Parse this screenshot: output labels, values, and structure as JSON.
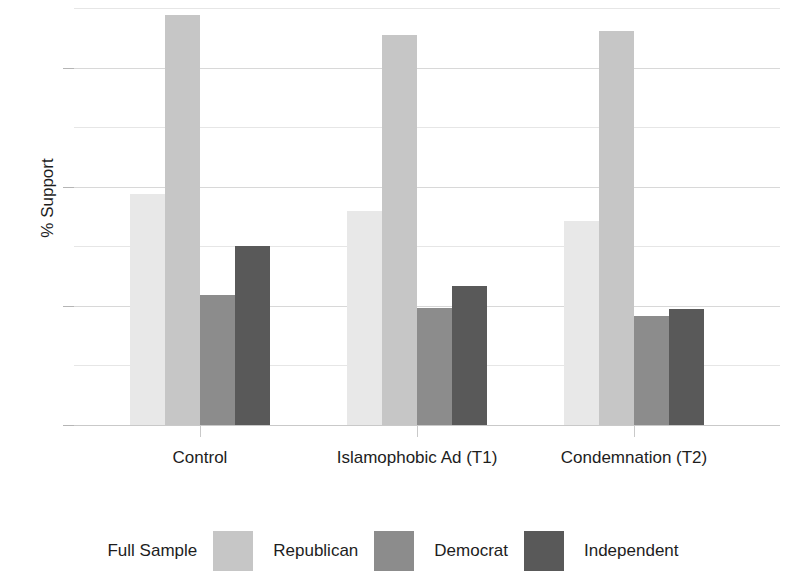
{
  "chart_data": {
    "type": "bar",
    "title": "",
    "xlabel": "",
    "ylabel": "% Support",
    "ylim": [
      0,
      70
    ],
    "y_ticks": [
      0,
      20,
      40,
      60
    ],
    "y_tick_labels": [
      "0",
      "20",
      "40",
      "60"
    ],
    "y_minor_ticks": [
      10,
      30,
      50,
      70
    ],
    "grid": true,
    "legend_position": "bottom",
    "categories": [
      "Control",
      "Islamophobic Ad (T1)",
      "Condemnation (T2)"
    ],
    "series": [
      {
        "name": "Full Sample",
        "color": "#e8e8e8",
        "values": [
          38.8,
          35.9,
          34.3
        ]
      },
      {
        "name": "Republican",
        "color": "#c6c6c6",
        "values": [
          68.8,
          65.4,
          66.2
        ]
      },
      {
        "name": "Democrat",
        "color": "#8c8c8c",
        "values": [
          21.9,
          19.7,
          18.3
        ]
      },
      {
        "name": "Independent",
        "color": "#595959",
        "values": [
          30.0,
          23.4,
          19.5
        ]
      }
    ]
  },
  "axes": {
    "y_title": "% Support"
  },
  "legend": {
    "entries": [
      {
        "label": "Full Sample",
        "color": "#e8e8e8"
      },
      {
        "label": "Republican",
        "color": "#c6c6c6"
      },
      {
        "label": "Democrat",
        "color": "#8c8c8c"
      },
      {
        "label": "Independent",
        "color": "#595959"
      }
    ]
  }
}
